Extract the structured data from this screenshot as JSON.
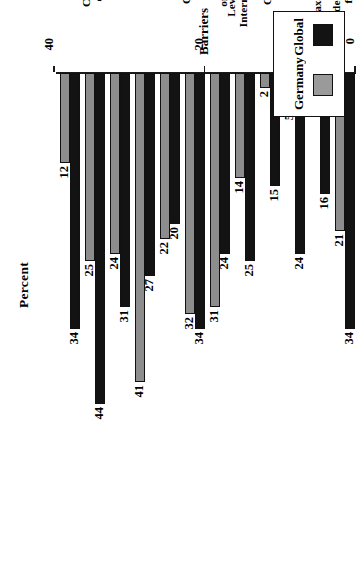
{
  "chart_data": {
    "type": "bar",
    "orientation": "horizontal",
    "title": "",
    "xlabel": "Percent",
    "ylabel": "Barriers",
    "xlim": [
      0,
      60
    ],
    "xticks": [
      0,
      20,
      40,
      60
    ],
    "grid": false,
    "legend_position": "top-left",
    "categories": [
      "Inadequate legal protection\nfor Internet purchases",
      "Taxation of Internet sales",
      "Business laws do not\nsupport e-commerce",
      "Cost of Internet access",
      "Level of ability to use the\nInternet as part of business strategy",
      "Making needed\norganizational changes",
      "Costs of implementing\ne-commerce site",
      "Prevalence of\ncredit card use",
      "Finding staff with\ne-commerce expertise",
      "Customers do not\nuse the technology",
      "Concern about privacy\nof data/security issues",
      "Need for face-to-face\ncustomer interaction"
    ],
    "series": [
      {
        "name": "Global",
        "color": "#131313",
        "values": [
          34,
          16,
          24,
          15,
          25,
          24,
          34,
          20,
          27,
          31,
          44,
          34
        ]
      },
      {
        "name": "Germany",
        "color": "#8d8d8d",
        "values": [
          21,
          2,
          5,
          2,
          14,
          31,
          32,
          22,
          41,
          24,
          25,
          12
        ]
      }
    ]
  },
  "axes": {
    "percent_title": "Percent",
    "barriers_title": "Barriers"
  },
  "legend": {
    "items": [
      {
        "label": "Global"
      },
      {
        "label": "Germany"
      }
    ]
  }
}
